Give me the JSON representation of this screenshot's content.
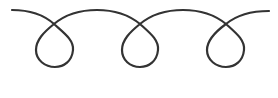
{
  "image": {
    "description": "Continuous hand-drawn curly line with three loops",
    "width": 278,
    "height": 98,
    "background": "#ffffff"
  },
  "stroke": {
    "color": "#333333",
    "width": 2.2
  },
  "curl": {
    "start": [
      12,
      10
    ],
    "end": [
      269,
      11
    ],
    "loop_count": 3,
    "crossings": [
      [
        54,
        24
      ],
      [
        140,
        24
      ],
      [
        226,
        24
      ]
    ],
    "loop_bottoms_y": 67
  }
}
